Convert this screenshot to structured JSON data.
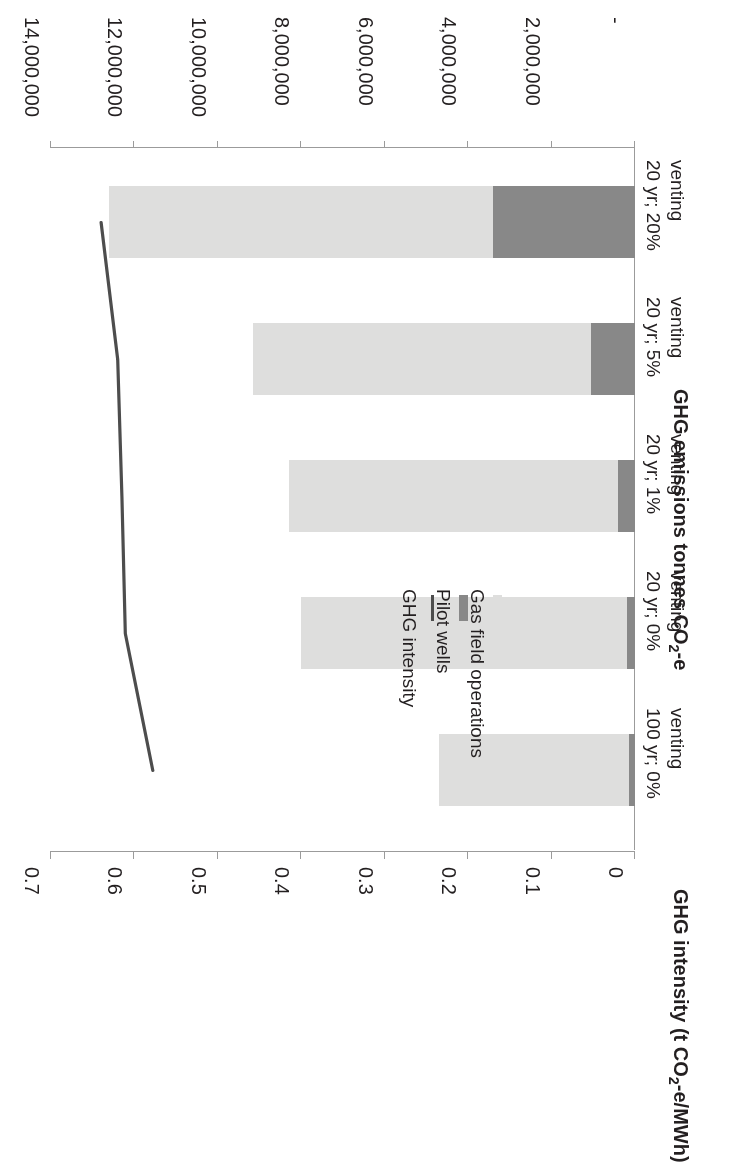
{
  "figure": {
    "orientation_note": "image-rotated-180",
    "background": "#ffffff"
  },
  "chart_data": {
    "type": "bar",
    "orientation": "vertical-stacked-with-line",
    "title": "",
    "subtitle": "",
    "categories": [
      "100 yr; 0% venting",
      "20 yr; 0% venting",
      "20 yr; 1% venting",
      "20 yr; 5% venting",
      "20 yr; 20% venting"
    ],
    "category_lines": [
      [
        "100 yr; 0%",
        "venting"
      ],
      [
        "20 yr; 0%",
        "venting"
      ],
      [
        "20 yr; 1%",
        "venting"
      ],
      [
        "20 yr; 5%",
        "venting"
      ],
      [
        "20 yr; 20%",
        "venting"
      ]
    ],
    "series": [
      {
        "name": "Pilot wells",
        "axis": "primary",
        "color": "#888888",
        "values": [
          150000,
          200000,
          400000,
          1050000,
          3400000
        ]
      },
      {
        "name": "Gas field operations",
        "axis": "primary",
        "color": "#dededd",
        "values": [
          4550000,
          7800000,
          7900000,
          8100000,
          9200000
        ]
      },
      {
        "name": "GHG intensity",
        "axis": "secondary",
        "type": "line",
        "color": "#4d4d4d",
        "values": [
          0.578,
          0.611,
          0.615,
          0.62,
          0.64
        ]
      }
    ],
    "totals": [
      4700000,
      8000000,
      8300000,
      9150000,
      12600000
    ],
    "xlabel": "",
    "ylabel": "GHG emissions tonnes CO₂-e",
    "y2label": "GHG intensity (t CO₂-e/MWh)",
    "ylim": [
      0,
      14000000
    ],
    "y2lim": [
      0,
      0.7
    ],
    "yticks": [
      0,
      2000000,
      4000000,
      6000000,
      8000000,
      10000000,
      12000000,
      14000000
    ],
    "ytick_labels": [
      "-",
      "2,000,000",
      "4,000,000",
      "6,000,000",
      "8,000,000",
      "10,000,000",
      "12,000,000",
      "14,000,000"
    ],
    "y2ticks": [
      0,
      0.1,
      0.2,
      0.3,
      0.4,
      0.5,
      0.6,
      0.7
    ],
    "y2tick_labels": [
      "0",
      "0.1",
      "0.2",
      "0.3",
      "0.4",
      "0.5",
      "0.6",
      "0.7"
    ],
    "grid": false,
    "legend_position": "inside-left",
    "legend": [
      "Gas field operations",
      "Pilot wells",
      "GHG intensity"
    ]
  },
  "axes": {
    "primary_title": "GHG emissions tonnes CO₂-e",
    "secondary_title": "GHG intensity (t CO₂-e/MWh)"
  },
  "legend": {
    "items": [
      {
        "label": "Gas field operations",
        "marker": "swatch-light-gray",
        "color": "#dededd"
      },
      {
        "label": "Pilot wells",
        "marker": "swatch-dark-gray",
        "color": "#888888"
      },
      {
        "label": "GHG intensity",
        "marker": "line-dark-gray",
        "color": "#4d4d4d"
      }
    ]
  }
}
